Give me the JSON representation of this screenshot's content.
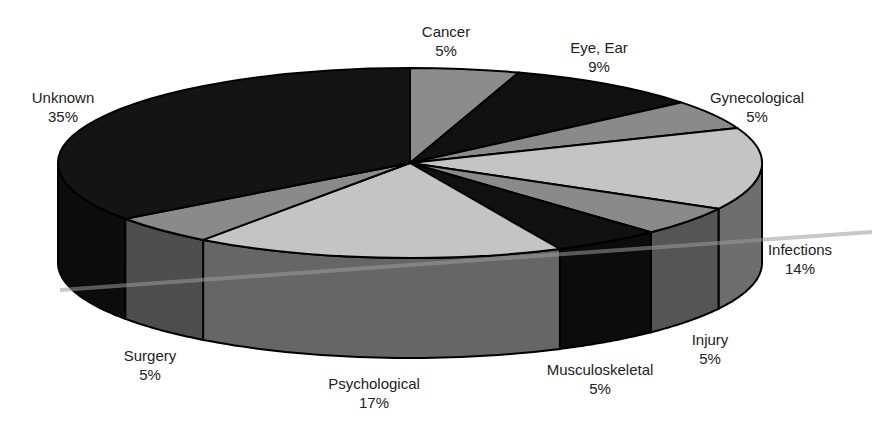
{
  "chart_data": {
    "type": "pie",
    "title": "",
    "style": "3d-pie",
    "slices": [
      {
        "label": "Cancer",
        "percent_label": "5%",
        "value": 5,
        "top_color": "#8c8c8c",
        "side_color": "#6a6a6a"
      },
      {
        "label": "Eye, Ear",
        "percent_label": "9%",
        "value": 9,
        "top_color": "#111111",
        "side_color": "#0a0a0a"
      },
      {
        "label": "Gynecological",
        "percent_label": "5%",
        "value": 5,
        "top_color": "#8a8a8a",
        "side_color": "#5e5e5e"
      },
      {
        "label": "Infections",
        "percent_label": "14%",
        "value": 14,
        "top_color": "#c4c4c4",
        "side_color": "#6e6e6e"
      },
      {
        "label": "Injury",
        "percent_label": "5%",
        "value": 5,
        "top_color": "#8a8a8a",
        "side_color": "#555555"
      },
      {
        "label": "Musculoskeletal",
        "percent_label": "5%",
        "value": 5,
        "top_color": "#111111",
        "side_color": "#0c0c0c"
      },
      {
        "label": "Psychological",
        "percent_label": "17%",
        "value": 17,
        "top_color": "#c4c4c4",
        "side_color": "#666666"
      },
      {
        "label": "Surgery",
        "percent_label": "5%",
        "value": 5,
        "top_color": "#8a8a8a",
        "side_color": "#4e4e4e"
      },
      {
        "label": "Unknown",
        "percent_label": "35%",
        "value": 35,
        "top_color": "#141414",
        "side_color": "#0c0c0c"
      }
    ],
    "start_angle_deg": 0,
    "direction": "clockwise",
    "legend": "none",
    "data_labels": "outside"
  }
}
